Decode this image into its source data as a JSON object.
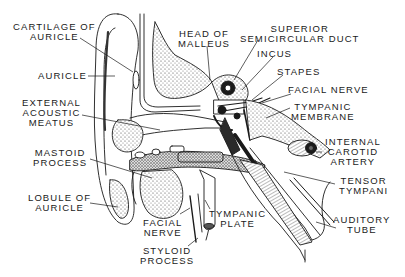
{
  "diagram": {
    "ink_color": "#1a1a1a",
    "background": "#ffffff",
    "labels": [
      {
        "id": "cartilage-of-auricle",
        "lines": [
          "CARTILAGE OF",
          "AURICLE"
        ]
      },
      {
        "id": "auricle",
        "lines": [
          "AURICLE"
        ]
      },
      {
        "id": "external-acoustic-meatus",
        "lines": [
          "EXTERNAL",
          "ACOUSTIC",
          "MEATUS"
        ]
      },
      {
        "id": "mastoid-process",
        "lines": [
          "MASTOID",
          "PROCESS"
        ]
      },
      {
        "id": "lobule-of-auricle",
        "lines": [
          "LOBULE OF",
          "AURICLE"
        ]
      },
      {
        "id": "facial-nerve-lower",
        "lines": [
          "FACIAL",
          "NERVE"
        ]
      },
      {
        "id": "styloid-process",
        "lines": [
          "STYLOID",
          "PROCESS"
        ]
      },
      {
        "id": "tympanic-plate",
        "lines": [
          "TYMPANIC",
          "PLATE"
        ]
      },
      {
        "id": "head-of-malleus",
        "lines": [
          "HEAD OF",
          "MALLEUS"
        ]
      },
      {
        "id": "superior-semicircular-duct",
        "lines": [
          "SUPERIOR",
          "SEMICIRCULAR DUCT"
        ]
      },
      {
        "id": "incus",
        "lines": [
          "INCUS"
        ]
      },
      {
        "id": "stapes",
        "lines": [
          "STAPES"
        ]
      },
      {
        "id": "facial-nerve-upper",
        "lines": [
          "FACIAL NERVE"
        ]
      },
      {
        "id": "tympanic-membrane",
        "lines": [
          "TYMPANIC",
          "MEMBRANE"
        ]
      },
      {
        "id": "internal-carotid-artery",
        "lines": [
          "INTERNAL",
          "CAROTID",
          "ARTERY"
        ]
      },
      {
        "id": "tensor-tympani",
        "lines": [
          "TENSOR",
          "TYMPANI"
        ]
      },
      {
        "id": "auditory-tube",
        "lines": [
          "AUDITORY",
          "TUBE"
        ]
      }
    ]
  }
}
